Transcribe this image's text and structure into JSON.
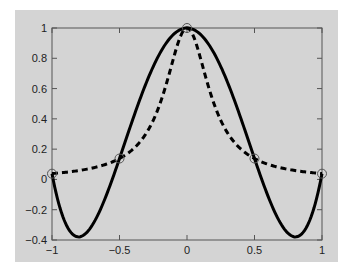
{
  "chart_data": {
    "type": "line",
    "title": "",
    "xlabel": "",
    "ylabel": "",
    "xlim": [
      -1,
      1
    ],
    "ylim": [
      -0.4,
      1
    ],
    "grid": false,
    "legend": null,
    "x_ticks": [
      "-1",
      "-0.5",
      "0",
      "0.5",
      "1"
    ],
    "y_ticks": [
      "-0.4",
      "-0.2",
      "0",
      "0.2",
      "0.4",
      "0.6",
      "0.8",
      "1"
    ],
    "series": [
      {
        "name": "Runge function 1/(1+25x^2)",
        "style": "dashed",
        "color": "#000000",
        "x": [
          -1,
          -0.9,
          -0.8,
          -0.7,
          -0.6,
          -0.5,
          -0.4,
          -0.3,
          -0.2,
          -0.1,
          0,
          0.1,
          0.2,
          0.3,
          0.4,
          0.5,
          0.6,
          0.7,
          0.8,
          0.9,
          1
        ],
        "values": [
          0.038,
          0.047,
          0.059,
          0.075,
          0.1,
          0.138,
          0.2,
          0.308,
          0.5,
          0.8,
          1.0,
          0.8,
          0.5,
          0.308,
          0.2,
          0.138,
          0.1,
          0.075,
          0.059,
          0.047,
          0.038
        ]
      },
      {
        "name": "4th-order interpolating polynomial",
        "style": "solid",
        "color": "#000000",
        "x": [
          -1,
          -0.9,
          -0.8,
          -0.7,
          -0.6,
          -0.5,
          -0.4,
          -0.3,
          -0.2,
          -0.1,
          0,
          0.1,
          0.2,
          0.3,
          0.4,
          0.5,
          0.6,
          0.7,
          0.8,
          0.9,
          1
        ],
        "values": [
          0.038,
          -0.289,
          -0.379,
          -0.26,
          0.03,
          0.138,
          0.4,
          0.642,
          0.834,
          0.958,
          1.0,
          0.958,
          0.834,
          0.642,
          0.4,
          0.138,
          0.03,
          -0.26,
          -0.379,
          -0.289,
          0.038
        ]
      },
      {
        "name": "interpolation nodes",
        "style": "markers-open-circle",
        "color": "#555555",
        "x": [
          -1,
          -0.5,
          0,
          0.5,
          1
        ],
        "values": [
          0.038,
          0.138,
          1.0,
          0.138,
          0.038
        ]
      }
    ]
  }
}
